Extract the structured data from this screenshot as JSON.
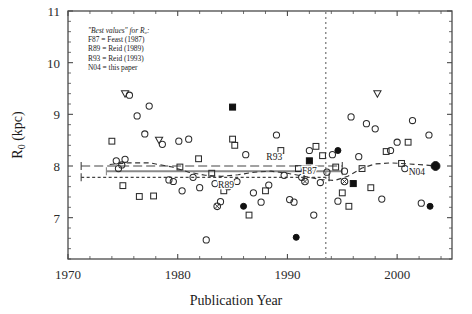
{
  "chart_data": {
    "type": "scatter",
    "title": "",
    "xlabel": "Publication Year",
    "ylabel": "R0 (kpc)",
    "xlim": [
      1970,
      2005
    ],
    "ylim": [
      6.2,
      11
    ],
    "xticks": [
      1970,
      1980,
      1990,
      2000
    ],
    "yticks": [
      7,
      8,
      9,
      10,
      11
    ],
    "xtick_labels": [
      "1970",
      "1980",
      "1990",
      "2000"
    ],
    "ytick_labels": [
      "7",
      "8",
      "9",
      "10",
      "11"
    ],
    "grid": false,
    "legend_position": "upper-left-inside",
    "minor_tick_step_y": 0.2,
    "minor_tick_step_x": 2,
    "series": [
      {
        "name": "open-circle",
        "marker": "circle-open",
        "points": [
          [
            1974.4,
            8.1
          ],
          [
            1974.6,
            7.95
          ],
          [
            1974.9,
            8.02
          ],
          [
            1975.2,
            8.13
          ],
          [
            1975.6,
            9.37
          ],
          [
            1976.3,
            8.97
          ],
          [
            1977.0,
            8.62
          ],
          [
            1977.4,
            9.16
          ],
          [
            1978.6,
            8.42
          ],
          [
            1979.2,
            7.73
          ],
          [
            1979.6,
            7.7
          ],
          [
            1980.1,
            8.48
          ],
          [
            1980.4,
            7.52
          ],
          [
            1981.0,
            8.52
          ],
          [
            1981.4,
            7.78
          ],
          [
            1982.0,
            7.58
          ],
          [
            1982.6,
            6.57
          ],
          [
            1983.4,
            7.66
          ],
          [
            1983.9,
            7.31
          ],
          [
            1984.6,
            7.6
          ],
          [
            1985.4,
            7.7
          ],
          [
            1986.2,
            8.22
          ],
          [
            1986.9,
            7.48
          ],
          [
            1987.6,
            7.3
          ],
          [
            1988.3,
            7.63
          ],
          [
            1989.0,
            8.6
          ],
          [
            1989.7,
            7.82
          ],
          [
            1990.2,
            7.35
          ],
          [
            1990.6,
            7.3
          ],
          [
            1991.3,
            7.78
          ],
          [
            1992.0,
            8.3
          ],
          [
            1992.4,
            7.05
          ],
          [
            1993.0,
            7.68
          ],
          [
            1993.6,
            7.88
          ],
          [
            1994.1,
            8.22
          ],
          [
            1994.6,
            7.32
          ],
          [
            1995.2,
            7.9
          ],
          [
            1995.8,
            8.95
          ],
          [
            1996.5,
            8.18
          ],
          [
            1997.2,
            8.82
          ],
          [
            1998.0,
            8.72
          ],
          [
            1998.6,
            7.36
          ],
          [
            1999.4,
            8.3
          ],
          [
            2000.0,
            8.46
          ],
          [
            2000.7,
            7.95
          ],
          [
            2001.4,
            8.88
          ],
          [
            2002.2,
            7.28
          ],
          [
            2002.9,
            8.6
          ]
        ]
      },
      {
        "name": "open-square",
        "marker": "square-open",
        "points": [
          [
            1974.0,
            8.48
          ],
          [
            1975.0,
            7.62
          ],
          [
            1976.5,
            7.41
          ],
          [
            1977.8,
            7.42
          ],
          [
            1980.2,
            7.98
          ],
          [
            1981.9,
            8.14
          ],
          [
            1983.1,
            7.86
          ],
          [
            1984.2,
            7.52
          ],
          [
            1985.0,
            8.52
          ],
          [
            1985.2,
            8.4
          ],
          [
            1986.5,
            7.05
          ],
          [
            1988.0,
            7.52
          ],
          [
            1989.4,
            8.3
          ],
          [
            1991.0,
            7.95
          ],
          [
            1992.6,
            8.38
          ],
          [
            1993.2,
            8.2
          ],
          [
            1994.4,
            7.98
          ],
          [
            1995.0,
            7.48
          ],
          [
            1995.6,
            7.22
          ],
          [
            1996.8,
            7.95
          ],
          [
            1997.6,
            7.58
          ],
          [
            1999.0,
            8.28
          ],
          [
            2000.4,
            8.05
          ],
          [
            2001.0,
            8.46
          ]
        ]
      },
      {
        "name": "open-triangle-down",
        "marker": "triangle-down-open",
        "points": [
          [
            1975.2,
            9.4
          ],
          [
            1978.3,
            8.5
          ],
          [
            1998.2,
            9.4
          ]
        ]
      },
      {
        "name": "filled-square",
        "marker": "square-filled",
        "points": [
          [
            1985.0,
            9.14
          ],
          [
            1992.0,
            8.1
          ],
          [
            1996.0,
            7.66
          ]
        ]
      },
      {
        "name": "filled-circle",
        "marker": "circle-filled",
        "points": [
          [
            1986.0,
            7.22
          ],
          [
            1990.8,
            6.62
          ],
          [
            1994.6,
            8.3
          ],
          [
            2003.0,
            7.22
          ]
        ]
      },
      {
        "name": "circled-x",
        "marker": "circle-cross",
        "points": [
          [
            1983.6,
            7.22
          ],
          [
            1991.6,
            7.7
          ],
          [
            1995.2,
            7.7
          ]
        ]
      },
      {
        "name": "N04-final",
        "marker": "circle-filled-large",
        "points": [
          [
            2003.5,
            8.0
          ]
        ]
      }
    ],
    "reference_lines": [
      {
        "label": "R93",
        "value": 8.0,
        "style": "dash-long",
        "x_start": 1971.2,
        "x_end": 1995.0,
        "caps": true
      },
      {
        "label": "F87",
        "value": 7.9,
        "style": "solid-grey",
        "x_start": 1973.5,
        "x_end": 1995.0,
        "caps": true
      },
      {
        "label": "R89",
        "value": 7.78,
        "style": "dash-short",
        "x_start": 1971.2,
        "x_end": 1993.8,
        "caps": true
      }
    ],
    "reference_label_positions": [
      {
        "label": "R93",
        "x": 1988.8,
        "y": 8.12
      },
      {
        "label": "F87",
        "x": 1992.0,
        "y": 7.84
      },
      {
        "label": "R89",
        "x": 1984.4,
        "y": 7.58
      },
      {
        "label": "N04",
        "x": 2001.8,
        "y": 7.82
      }
    ],
    "running_mean_curve": {
      "style": "dashed",
      "points": [
        [
          1973.8,
          8.03
        ],
        [
          1975.5,
          8.06
        ],
        [
          1977.5,
          8.06
        ],
        [
          1979.5,
          7.98
        ],
        [
          1981.0,
          7.88
        ],
        [
          1982.5,
          7.82
        ],
        [
          1984.0,
          7.8
        ],
        [
          1985.5,
          7.83
        ],
        [
          1987.0,
          7.88
        ],
        [
          1988.5,
          7.9
        ],
        [
          1990.0,
          7.86
        ],
        [
          1991.5,
          7.8
        ],
        [
          1993.0,
          7.74
        ],
        [
          1994.3,
          7.72
        ],
        [
          1995.5,
          7.8
        ],
        [
          1996.8,
          7.96
        ],
        [
          1998.0,
          8.04
        ],
        [
          1999.5,
          8.06
        ],
        [
          2001.0,
          8.04
        ],
        [
          2002.5,
          8.02
        ],
        [
          2003.5,
          8.0
        ]
      ]
    },
    "vertical_marker": {
      "x": 1993.5,
      "style": "dotted"
    }
  },
  "legend": {
    "header": "\"Best values\" for R₀:",
    "entries": [
      "F87 = Feast (1987)",
      "R89 = Reid (1989)",
      "R93 = Reid (1993)",
      "N04 = this paper"
    ]
  },
  "axes": {
    "ylabel_main": "R",
    "ylabel_sub": "0",
    "ylabel_unit": " (kpc)",
    "xlabel": "Publication Year"
  },
  "colors": {
    "axis": "#4a4a4a",
    "marker": "#2b2b2b",
    "reference_grey": "#8a8a8a",
    "text": "#1a1a1a"
  }
}
